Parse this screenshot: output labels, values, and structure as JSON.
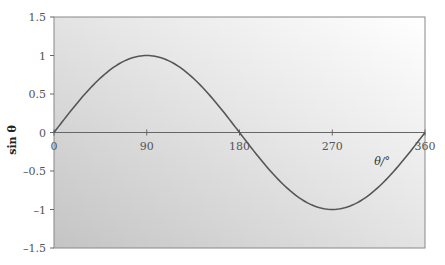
{
  "chart_data": {
    "type": "line",
    "title": "",
    "xlabel": "θ/°",
    "ylabel": "sin θ",
    "xlim": [
      0,
      360
    ],
    "ylim": [
      -1.5,
      1.5
    ],
    "x_ticks": [
      0,
      90,
      180,
      270,
      360
    ],
    "x_tick_labels": [
      "0",
      "90",
      "180",
      "270",
      "360"
    ],
    "y_ticks": [
      1.5,
      1,
      0.5,
      0,
      -0.5,
      -1,
      -1.5
    ],
    "y_tick_labels": [
      "1.5",
      "1",
      "0.5",
      "0",
      "–0.5",
      "–1",
      "–1.5"
    ],
    "grid": false,
    "legend": null,
    "series": [
      {
        "name": "sin θ",
        "function": "sin",
        "x": [
          0,
          30,
          60,
          90,
          120,
          150,
          180,
          210,
          240,
          270,
          300,
          330,
          360
        ],
        "values": [
          0,
          0.5,
          0.866,
          1,
          0.866,
          0.5,
          0,
          -0.5,
          -0.866,
          -1,
          -0.866,
          -0.5,
          0
        ]
      }
    ],
    "colors": {
      "line": "#555555",
      "axis": "#666666",
      "bg_dark": "#c8c8c8",
      "bg_light": "#ffffff"
    }
  }
}
